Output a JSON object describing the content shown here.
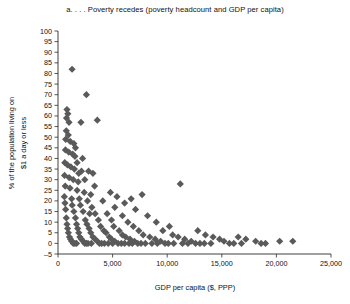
{
  "chart_data": {
    "type": "scatter",
    "title": "a. . . . Poverty recedes (poverty headcount and GDP per capita)",
    "xlabel": "GDP per capita ($, PPP)",
    "ylabel_line1": "% of the population living on",
    "ylabel_line2": "$1 a day or less",
    "xlim": [
      0,
      25000
    ],
    "ylim": [
      -5,
      100
    ],
    "xticks": [
      0,
      5000,
      10000,
      15000,
      20000,
      25000
    ],
    "xticklabels": [
      "0",
      "5,000",
      "10,000",
      "15,000",
      "20,000",
      "25,000"
    ],
    "yticks": [
      -5,
      0,
      5,
      10,
      15,
      20,
      25,
      30,
      35,
      40,
      45,
      50,
      55,
      60,
      65,
      70,
      75,
      80,
      85,
      90,
      95,
      100
    ],
    "yticklabels": [
      "-5",
      "0",
      "5",
      "10",
      "15",
      "20",
      "25",
      "30",
      "35",
      "40",
      "45",
      "50",
      "55",
      "60",
      "65",
      "70",
      "75",
      "80",
      "85",
      "90",
      "95",
      "100"
    ],
    "grid": false,
    "legend": null,
    "marker_shape": "diamond",
    "marker_color": "#5a5a5a",
    "marker_size": 3.6,
    "points": [
      [
        1290,
        82
      ],
      [
        820,
        63
      ],
      [
        900,
        61
      ],
      [
        780,
        59
      ],
      [
        1010,
        57
      ],
      [
        2100,
        57
      ],
      [
        3600,
        58
      ],
      [
        760,
        53
      ],
      [
        940,
        51
      ],
      [
        700,
        49
      ],
      [
        1120,
        48
      ],
      [
        1450,
        47
      ],
      [
        1600,
        45
      ],
      [
        2600,
        70
      ],
      [
        680,
        44
      ],
      [
        980,
        43
      ],
      [
        1350,
        42
      ],
      [
        1550,
        41
      ],
      [
        2250,
        40
      ],
      [
        620,
        38
      ],
      [
        860,
        37
      ],
      [
        1180,
        36
      ],
      [
        1500,
        35
      ],
      [
        2800,
        34
      ],
      [
        3200,
        33
      ],
      [
        600,
        32
      ],
      [
        1020,
        31
      ],
      [
        1400,
        30
      ],
      [
        1850,
        29
      ],
      [
        11200,
        28
      ],
      [
        660,
        27
      ],
      [
        1100,
        26
      ],
      [
        1750,
        25
      ],
      [
        2400,
        24
      ],
      [
        3000,
        23
      ],
      [
        7700,
        23
      ],
      [
        580,
        22
      ],
      [
        1250,
        21
      ],
      [
        1950,
        21
      ],
      [
        2700,
        20
      ],
      [
        4100,
        20
      ],
      [
        640,
        19
      ],
      [
        1300,
        18
      ],
      [
        2050,
        18
      ],
      [
        3100,
        17
      ],
      [
        5200,
        17
      ],
      [
        7100,
        16
      ],
      [
        700,
        16
      ],
      [
        1450,
        15
      ],
      [
        2300,
        15
      ],
      [
        3400,
        14
      ],
      [
        4500,
        14
      ],
      [
        5900,
        13
      ],
      [
        8200,
        13
      ],
      [
        760,
        12
      ],
      [
        1600,
        12
      ],
      [
        2500,
        11
      ],
      [
        3700,
        11
      ],
      [
        4900,
        11
      ],
      [
        6400,
        10
      ],
      [
        9000,
        10
      ],
      [
        820,
        9
      ],
      [
        1700,
        9
      ],
      [
        2650,
        9
      ],
      [
        3900,
        8
      ],
      [
        5100,
        8
      ],
      [
        6900,
        8
      ],
      [
        10200,
        8
      ],
      [
        880,
        7
      ],
      [
        1800,
        7
      ],
      [
        2850,
        7
      ],
      [
        4200,
        6
      ],
      [
        5600,
        6
      ],
      [
        7400,
        6
      ],
      [
        9600,
        6
      ],
      [
        12800,
        6
      ],
      [
        950,
        5
      ],
      [
        1900,
        5
      ],
      [
        3000,
        5
      ],
      [
        4400,
        5
      ],
      [
        5900,
        4
      ],
      [
        7800,
        4
      ],
      [
        10500,
        4
      ],
      [
        13500,
        4
      ],
      [
        1050,
        3
      ],
      [
        2000,
        3
      ],
      [
        3200,
        3
      ],
      [
        4700,
        3
      ],
      [
        6200,
        3
      ],
      [
        8400,
        3
      ],
      [
        11000,
        3
      ],
      [
        14200,
        3
      ],
      [
        16500,
        3
      ],
      [
        1150,
        2
      ],
      [
        2150,
        2
      ],
      [
        3400,
        2
      ],
      [
        4900,
        2
      ],
      [
        6600,
        2
      ],
      [
        8900,
        2
      ],
      [
        11600,
        2
      ],
      [
        14800,
        2
      ],
      [
        17200,
        2
      ],
      [
        1250,
        1
      ],
      [
        2300,
        1
      ],
      [
        3600,
        1
      ],
      [
        5200,
        1
      ],
      [
        7000,
        1
      ],
      [
        9400,
        1
      ],
      [
        12200,
        1
      ],
      [
        15200,
        1
      ],
      [
        18100,
        1
      ],
      [
        20300,
        1
      ],
      [
        21500,
        1
      ],
      [
        1400,
        0
      ],
      [
        2450,
        0
      ],
      [
        3800,
        0
      ],
      [
        5500,
        0
      ],
      [
        7300,
        0
      ],
      [
        9800,
        0
      ],
      [
        12600,
        0
      ],
      [
        15700,
        0
      ],
      [
        18600,
        0
      ],
      [
        1550,
        0
      ],
      [
        2600,
        0
      ],
      [
        4000,
        0
      ],
      [
        5800,
        0
      ],
      [
        7600,
        0
      ],
      [
        10100,
        0
      ],
      [
        13000,
        0
      ],
      [
        16100,
        0
      ],
      [
        19000,
        0
      ],
      [
        1700,
        0
      ],
      [
        2750,
        0
      ],
      [
        4250,
        0
      ],
      [
        6100,
        0
      ],
      [
        8000,
        0
      ],
      [
        10600,
        0
      ],
      [
        13400,
        0
      ],
      [
        16800,
        0
      ],
      [
        3050,
        0
      ],
      [
        4600,
        0
      ],
      [
        6500,
        0
      ],
      [
        8600,
        0
      ],
      [
        11400,
        0
      ],
      [
        14000,
        0
      ],
      [
        5000,
        0
      ],
      [
        6800,
        0
      ],
      [
        9100,
        0
      ],
      [
        11900,
        0
      ],
      [
        2900,
        14
      ],
      [
        2150,
        34
      ],
      [
        1750,
        38
      ],
      [
        5400,
        22
      ],
      [
        6100,
        19
      ],
      [
        6700,
        21
      ],
      [
        4800,
        24
      ],
      [
        3350,
        27
      ],
      [
        2450,
        30
      ],
      [
        1900,
        33
      ]
    ]
  }
}
